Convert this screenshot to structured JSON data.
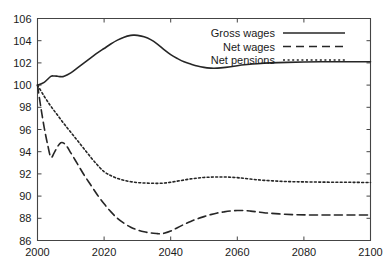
{
  "chart_data": {
    "type": "line",
    "title": "",
    "subtitle": "",
    "xlabel": "",
    "ylabel": "",
    "xlim": [
      2000,
      2100
    ],
    "ylim": [
      86,
      106
    ],
    "xticks": [
      2000,
      2020,
      2040,
      2060,
      2080,
      2100
    ],
    "yticks": [
      86,
      88,
      90,
      92,
      94,
      96,
      98,
      100,
      102,
      104,
      106
    ],
    "xtick_labels": [
      "2000",
      "2020",
      "2040",
      "2060",
      "2080",
      "2100"
    ],
    "ytick_labels": [
      "86",
      "88",
      "90",
      "92",
      "94",
      "96",
      "98",
      "100",
      "102",
      "104",
      "106"
    ],
    "grid": false,
    "legend_position": "top-right",
    "series": [
      {
        "name": "Gross wages",
        "style": "solid",
        "color": "#262626",
        "x": [
          2000,
          2002,
          2004,
          2005,
          2006,
          2007,
          2008,
          2010,
          2012,
          2014,
          2016,
          2018,
          2020,
          2022,
          2024,
          2026,
          2028,
          2029,
          2030,
          2032,
          2034,
          2036,
          2038,
          2040,
          2042,
          2044,
          2046,
          2048,
          2050,
          2052,
          2053,
          2055,
          2058,
          2060,
          2063,
          2066,
          2070,
          2075,
          2080,
          2085,
          2090,
          2095,
          2100
        ],
        "values": [
          100.0,
          100.25,
          100.78,
          100.82,
          100.8,
          100.76,
          100.8,
          101.1,
          101.55,
          102.0,
          102.45,
          102.9,
          103.3,
          103.7,
          104.05,
          104.32,
          104.48,
          104.5,
          104.48,
          104.35,
          104.1,
          103.7,
          103.2,
          102.75,
          102.4,
          102.1,
          101.9,
          101.72,
          101.6,
          101.53,
          101.52,
          101.55,
          101.65,
          101.75,
          101.85,
          101.93,
          102.0,
          102.05,
          102.08,
          102.1,
          102.1,
          102.1,
          102.1
        ]
      },
      {
        "name": "Net wages",
        "style": "dashed",
        "color": "#262626",
        "x": [
          2000,
          2001,
          2002,
          2003,
          2004,
          2005,
          2006,
          2007,
          2008,
          2009,
          2010,
          2012,
          2014,
          2016,
          2018,
          2020,
          2022,
          2024,
          2026,
          2028,
          2030,
          2032,
          2034,
          2036,
          2037,
          2038,
          2040,
          2042,
          2044,
          2046,
          2048,
          2050,
          2052,
          2054,
          2056,
          2058,
          2060,
          2062,
          2064,
          2066,
          2068,
          2070,
          2074,
          2078,
          2082,
          2086,
          2090,
          2095,
          2100
        ],
        "values": [
          100.0,
          98.0,
          96.2,
          94.7,
          93.5,
          93.9,
          94.45,
          94.8,
          94.75,
          94.4,
          93.9,
          92.9,
          91.9,
          91.0,
          90.1,
          89.3,
          88.6,
          88.0,
          87.55,
          87.2,
          86.95,
          86.78,
          86.68,
          86.62,
          86.6,
          86.65,
          86.85,
          87.15,
          87.45,
          87.72,
          87.95,
          88.15,
          88.33,
          88.48,
          88.58,
          88.66,
          88.7,
          88.7,
          88.65,
          88.58,
          88.5,
          88.45,
          88.37,
          88.32,
          88.3,
          88.3,
          88.3,
          88.3,
          88.3
        ]
      },
      {
        "name": "Net pensions",
        "style": "dotted",
        "color": "#262626",
        "x": [
          2000,
          2002,
          2004,
          2006,
          2008,
          2010,
          2012,
          2014,
          2016,
          2018,
          2020,
          2022,
          2024,
          2026,
          2028,
          2030,
          2032,
          2034,
          2036,
          2038,
          2040,
          2042,
          2044,
          2046,
          2048,
          2050,
          2052,
          2054,
          2056,
          2058,
          2060,
          2062,
          2065,
          2068,
          2072,
          2076,
          2080,
          2085,
          2090,
          2095,
          2100
        ],
        "values": [
          100.0,
          99.0,
          98.1,
          97.3,
          96.5,
          95.75,
          95.0,
          94.25,
          93.5,
          92.8,
          92.2,
          91.85,
          91.6,
          91.42,
          91.3,
          91.22,
          91.18,
          91.16,
          91.15,
          91.17,
          91.25,
          91.35,
          91.45,
          91.55,
          91.62,
          91.68,
          91.71,
          91.72,
          91.72,
          91.7,
          91.66,
          91.6,
          91.5,
          91.42,
          91.35,
          91.3,
          91.28,
          91.26,
          91.25,
          91.24,
          91.22
        ]
      }
    ]
  },
  "legend": {
    "entries": [
      {
        "label": "Gross wages",
        "style": "solid"
      },
      {
        "label": "Net wages",
        "style": "dashed"
      },
      {
        "label": "Net pensions",
        "style": "dotted"
      }
    ]
  }
}
